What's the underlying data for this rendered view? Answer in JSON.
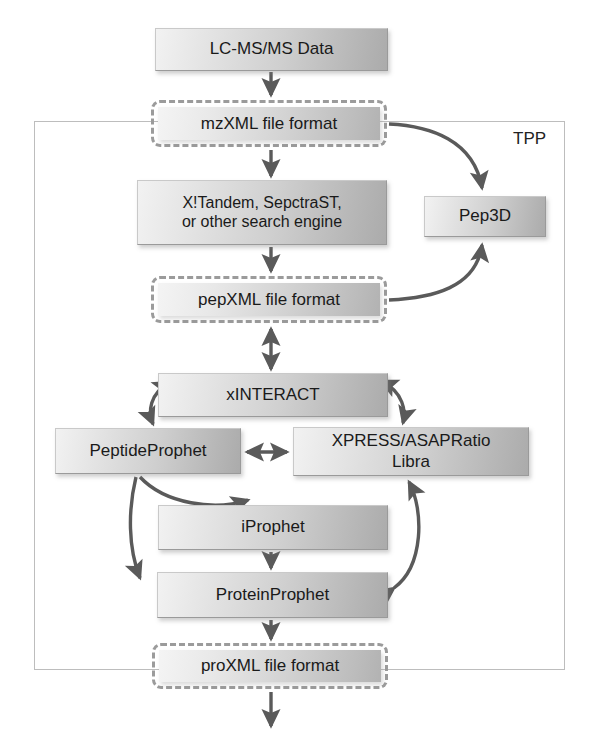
{
  "diagram": {
    "container": {
      "label": "TPP",
      "x": 34,
      "y": 121,
      "width": 531,
      "height": 549
    },
    "palette": {
      "box_fill_light": "#f2f2f2",
      "box_fill_dark": "#ababab",
      "box_border": "#9a9a9a",
      "dashed_border": "#9b9b9b",
      "frame_border": "#bdbdbd",
      "arrow": "#5a5a5a",
      "text": "#1a1a1a",
      "background": "#ffffff"
    },
    "nodes": [
      {
        "id": "lcmsms",
        "label": "LC-MS/MS Data",
        "style": "solid",
        "x": 155,
        "y": 28,
        "width": 233,
        "height": 43,
        "font_size": 17
      },
      {
        "id": "mzxml",
        "label": "mzXML file format",
        "style": "dashed",
        "x": 151,
        "y": 100,
        "width": 236,
        "height": 47,
        "font_size": 17
      },
      {
        "id": "search_engine",
        "label": "X!Tandem, SepctraST,\nor other search engine",
        "style": "solid",
        "x": 137,
        "y": 180,
        "width": 250,
        "height": 65,
        "font_size": 16
      },
      {
        "id": "pep3d",
        "label": "Pep3D",
        "style": "solid",
        "x": 424,
        "y": 196,
        "width": 122,
        "height": 41,
        "font_size": 17
      },
      {
        "id": "pepxml",
        "label": "pepXML file format",
        "style": "dashed",
        "x": 151,
        "y": 276,
        "width": 236,
        "height": 47,
        "font_size": 17
      },
      {
        "id": "xinteract",
        "label": "xINTERACT",
        "style": "solid",
        "x": 158,
        "y": 373,
        "width": 230,
        "height": 44,
        "font_size": 17
      },
      {
        "id": "peptideprophet",
        "label": "PeptideProphet",
        "style": "solid",
        "x": 55,
        "y": 428,
        "width": 186,
        "height": 46,
        "font_size": 17
      },
      {
        "id": "xpress",
        "label": "XPRESS/ASAPRatio\nLibra",
        "style": "solid",
        "x": 293,
        "y": 427,
        "width": 236,
        "height": 49,
        "font_size": 17
      },
      {
        "id": "iprophet",
        "label": "iProphet",
        "style": "solid",
        "x": 158,
        "y": 505,
        "width": 230,
        "height": 45,
        "font_size": 17
      },
      {
        "id": "proteinprophet",
        "label": "ProteinProphet",
        "style": "solid",
        "x": 157,
        "y": 572,
        "width": 231,
        "height": 46,
        "font_size": 17
      },
      {
        "id": "proxml",
        "label": "proXML file format",
        "style": "dashed",
        "x": 152,
        "y": 643,
        "width": 236,
        "height": 46,
        "font_size": 17
      }
    ],
    "edges": [
      {
        "id": "lcmsms-to-mzxml",
        "from": "lcmsms",
        "to": "mzxml",
        "kind": "straight",
        "direction": "one-way"
      },
      {
        "id": "mzxml-to-search",
        "from": "mzxml",
        "to": "search_engine",
        "kind": "straight",
        "direction": "one-way"
      },
      {
        "id": "mzxml-to-pep3d",
        "from": "mzxml",
        "to": "pep3d",
        "kind": "curved",
        "direction": "one-way"
      },
      {
        "id": "search-to-pepxml",
        "from": "search_engine",
        "to": "pepxml",
        "kind": "straight",
        "direction": "one-way"
      },
      {
        "id": "pepxml-to-pep3d",
        "from": "pepxml",
        "to": "pep3d",
        "kind": "curved",
        "direction": "one-way"
      },
      {
        "id": "pepxml-to-xinteract",
        "from": "pepxml",
        "to": "xinteract",
        "kind": "straight",
        "direction": "two-way"
      },
      {
        "id": "xinteract-to-peptideprophet",
        "from": "xinteract",
        "to": "peptideprophet",
        "kind": "curved",
        "direction": "two-way"
      },
      {
        "id": "xinteract-to-xpress",
        "from": "xinteract",
        "to": "xpress",
        "kind": "curved",
        "direction": "two-way"
      },
      {
        "id": "peptideprophet-to-xpress",
        "from": "peptideprophet",
        "to": "xpress",
        "kind": "straight",
        "direction": "two-way"
      },
      {
        "id": "peptideprophet-to-iprophet",
        "from": "peptideprophet",
        "to": "iprophet",
        "kind": "curved",
        "direction": "one-way"
      },
      {
        "id": "peptideprophet-to-protein",
        "from": "peptideprophet",
        "to": "proteinprophet",
        "kind": "curved",
        "direction": "one-way"
      },
      {
        "id": "iprophet-to-protein",
        "from": "iprophet",
        "to": "proteinprophet",
        "kind": "straight",
        "direction": "one-way"
      },
      {
        "id": "protein-to-xpress",
        "from": "proteinprophet",
        "to": "xpress",
        "kind": "curved",
        "direction": "two-way"
      },
      {
        "id": "protein-to-proxml",
        "from": "proteinprophet",
        "to": "proxml",
        "kind": "straight",
        "direction": "one-way"
      },
      {
        "id": "proxml-out",
        "from": "proxml",
        "to": null,
        "kind": "straight",
        "direction": "one-way"
      }
    ]
  }
}
